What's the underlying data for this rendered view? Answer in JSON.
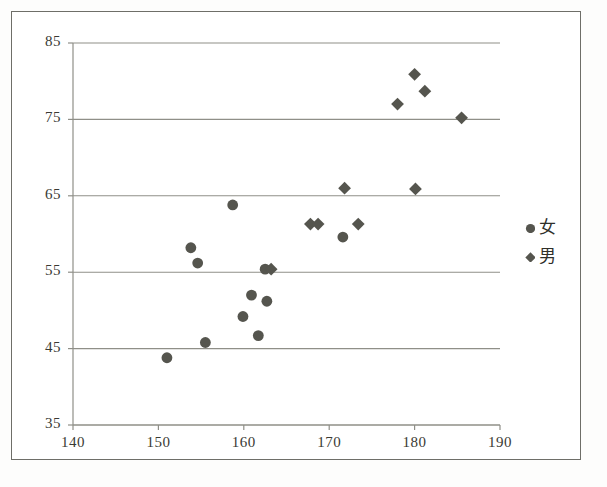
{
  "chart_data": {
    "type": "scatter",
    "title": "",
    "xlabel": "",
    "ylabel": "",
    "xlim": [
      140,
      190
    ],
    "ylim": [
      35,
      85
    ],
    "xticks": [
      140,
      150,
      160,
      170,
      180,
      190
    ],
    "yticks": [
      35,
      45,
      55,
      65,
      75,
      85
    ],
    "grid": "horizontal",
    "legend_position": "right",
    "marker_color": "#55554e",
    "gridline_color": "#8f8f88",
    "axis_color": "#8f8f88",
    "series": [
      {
        "name": "女",
        "marker": "circle",
        "color": "#55554e",
        "points": [
          [
            151.0,
            43.8
          ],
          [
            153.8,
            58.2
          ],
          [
            154.6,
            56.2
          ],
          [
            155.5,
            45.8
          ],
          [
            158.7,
            63.8
          ],
          [
            159.9,
            49.2
          ],
          [
            160.9,
            52.0
          ],
          [
            161.7,
            46.7
          ],
          [
            162.7,
            51.2
          ],
          [
            162.5,
            55.4
          ],
          [
            171.6,
            59.6
          ]
        ]
      },
      {
        "name": "男",
        "marker": "diamond",
        "color": "#55554e",
        "points": [
          [
            163.2,
            55.4
          ],
          [
            167.8,
            61.3
          ],
          [
            168.7,
            61.3
          ],
          [
            171.8,
            66.0
          ],
          [
            173.4,
            61.3
          ],
          [
            178.0,
            77.0
          ],
          [
            180.0,
            80.9
          ],
          [
            181.2,
            78.7
          ],
          [
            180.1,
            65.9
          ],
          [
            185.5,
            75.2
          ]
        ]
      }
    ],
    "legend": [
      {
        "label": "女",
        "marker": "circle"
      },
      {
        "label": "男",
        "marker": "diamond"
      }
    ]
  }
}
